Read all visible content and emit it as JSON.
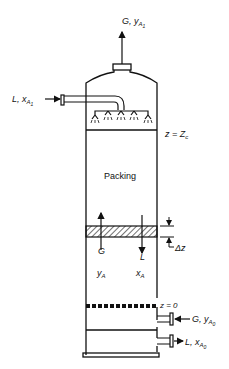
{
  "diagram": {
    "labels": {
      "gas_out": {
        "main": "G, y",
        "sub": "A",
        "subsub": "1"
      },
      "liquid_in": {
        "main": "L, x",
        "sub": "A",
        "subsub": "1"
      },
      "top_level": {
        "main": "z = Z",
        "sub": "c"
      },
      "packing": "Packing",
      "gas_flow": "G",
      "liquid_flow": "L",
      "gas_comp": {
        "main": "y",
        "sub": "A"
      },
      "liquid_comp": {
        "main": "x",
        "sub": "A"
      },
      "delta_z": "Δz",
      "bottom_level": "z = 0",
      "gas_in": {
        "main": "G, y",
        "sub": "A",
        "subsub": "0"
      },
      "liquid_out": {
        "main": "L, x",
        "sub": "A",
        "subsub": "0"
      }
    },
    "colors": {
      "line": "#111111",
      "background": "#ffffff"
    }
  }
}
